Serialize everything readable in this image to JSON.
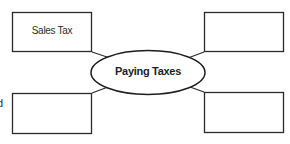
{
  "diagram": {
    "type": "concept-web",
    "center": {
      "label": "Paying Taxes"
    },
    "boxes": [
      {
        "position": "top-left",
        "label": "Sales Tax"
      },
      {
        "position": "top-right",
        "label": ""
      },
      {
        "position": "bottom-left",
        "label": ""
      },
      {
        "position": "bottom-right",
        "label": ""
      }
    ],
    "edge_fragment": "d",
    "colors": {
      "stroke": "#2b2b2b",
      "background": "#ffffff"
    }
  }
}
